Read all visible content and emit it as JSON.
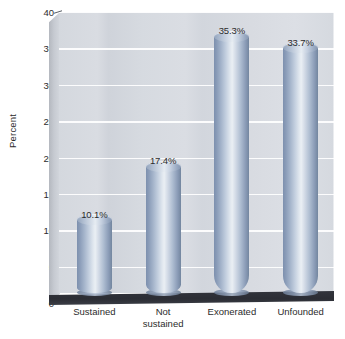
{
  "chart_data": {
    "type": "bar",
    "title": "",
    "subtitle": "",
    "xlabel": "",
    "ylabel": "Percent",
    "categories": [
      "Sustained",
      "Not sustained",
      "Exonerated",
      "Unfounded"
    ],
    "category_lines": [
      [
        "Sustained"
      ],
      [
        "Not",
        "sustained"
      ],
      [
        "Exonerated"
      ],
      [
        "Unfounded"
      ]
    ],
    "values": [
      10.1,
      17.4,
      35.3,
      33.7
    ],
    "data_labels": [
      "10.1%",
      "17.4%",
      "35.3%",
      "33.7%"
    ],
    "ylim": [
      0,
      40
    ],
    "ytick_values": [
      0,
      5,
      10,
      15,
      20,
      25,
      30,
      35,
      40
    ],
    "ytick_labels": [
      "0",
      "5",
      "10",
      "15",
      "20",
      "25",
      "30",
      "35",
      "40"
    ],
    "grid": true,
    "legend": "none",
    "style": "3d-cylinder",
    "colors": {
      "bar_light": "#e6ecf2",
      "bar_mid": "#aebdd1",
      "bar_dark": "#73869f",
      "plot_background": "#d6dae0",
      "left_wall": "#c6cad1",
      "floor": "#2f3139",
      "gridline": "#ffffff",
      "text": "#2c2c2c",
      "page_background": "#ffffff"
    }
  }
}
